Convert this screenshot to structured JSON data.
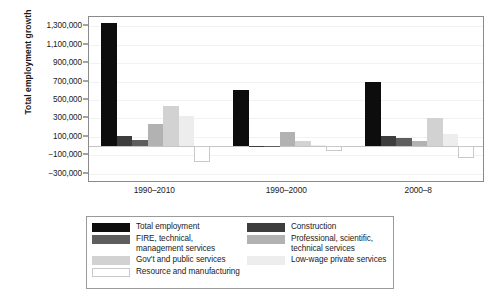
{
  "chart_data": {
    "type": "bar",
    "title": "",
    "subtitle": "",
    "xlabel": "",
    "ylabel": "Total employment growth",
    "categories": [
      "1990–2010",
      "1990–2000",
      "2000–8"
    ],
    "ylim": [
      -400000,
      1400000
    ],
    "yticks": [
      1300000,
      1100000,
      900000,
      700000,
      500000,
      300000,
      100000,
      -100000,
      -300000
    ],
    "ytick_labels": [
      "1,300,000",
      "1,100,000",
      "900,000",
      "700,000",
      "500,000",
      "300,000",
      "100,000",
      "−100,000",
      "−300,000"
    ],
    "grid": true,
    "legend_position": "below",
    "series": [
      {
        "name": "Total employment",
        "color": "#0d0d0d",
        "values": [
          1340000,
          610000,
          690000
        ]
      },
      {
        "name": "Construction",
        "color": "#3d3d3d",
        "values": [
          110000,
          5000,
          105000
        ]
      },
      {
        "name": "FIRE, technical, management services",
        "label_line1": "FIRE, technical,",
        "label_line2": "management services",
        "color": "#5e5e5e",
        "values": [
          70000,
          -15000,
          85000
        ]
      },
      {
        "name": "Professional, scientific, technical services",
        "label_line1": "Professional, scientific,",
        "label_line2": "technical services",
        "color": "#b2b2b2",
        "values": [
          240000,
          150000,
          55000
        ]
      },
      {
        "name": "Gov't and public services",
        "color": "#d2d2d2",
        "values": [
          430000,
          60000,
          300000
        ]
      },
      {
        "name": "Low-wage private services",
        "color": "#ededed",
        "values": [
          330000,
          8000,
          130000
        ]
      },
      {
        "name": "Resource and manufacturing",
        "color": "#ffffff",
        "border": "#c9c9c9",
        "values": [
          -170000,
          -50000,
          -130000
        ]
      }
    ]
  },
  "legend": {
    "left_column": [
      {
        "label": "Total employment",
        "color": "#0d0d0d"
      },
      {
        "label_line1": "FIRE, technical,",
        "label_line2": "management services",
        "color": "#5e5e5e"
      },
      {
        "label": "Gov't and public services",
        "color": "#d2d2d2"
      },
      {
        "label": "Resource and manufacturing",
        "color": "#ffffff"
      }
    ],
    "right_column": [
      {
        "label": "Construction",
        "color": "#3d3d3d"
      },
      {
        "label_line1": "Professional, scientific,",
        "label_line2": "technical services",
        "color": "#b2b2b2"
      },
      {
        "label": "Low-wage private services",
        "color": "#ededed"
      }
    ]
  }
}
